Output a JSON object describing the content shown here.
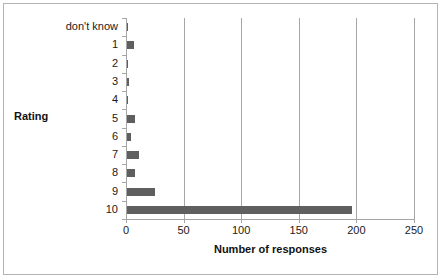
{
  "chart_data": {
    "type": "bar",
    "orientation": "horizontal",
    "title": "",
    "xlabel": "Number of responses",
    "ylabel": "Rating",
    "categories": [
      "don't know",
      "1",
      "2",
      "3",
      "4",
      "5",
      "6",
      "7",
      "8",
      "9",
      "10"
    ],
    "values": [
      2,
      7,
      1,
      3,
      2,
      8,
      4,
      11,
      8,
      25,
      196
    ],
    "xlim": [
      0,
      250
    ],
    "xticks": [
      0,
      50,
      100,
      150,
      200,
      250
    ],
    "xticklabels": [
      "0",
      "50",
      "100",
      "150",
      "200",
      "250"
    ],
    "grid": "vertical",
    "legend": "none",
    "bar_color": "#5f5f5f",
    "axis_color": "#a6a6a6",
    "frame_color": "#b4b4b4",
    "background": "#ffffff"
  },
  "labels": {
    "y_axis_title": "Rating",
    "x_axis_title": "Number of responses"
  }
}
